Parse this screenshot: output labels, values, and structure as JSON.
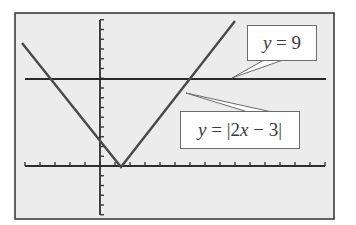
{
  "figure": {
    "background": "#ffffff",
    "screen_fill": "#ececec",
    "frame_color": "#3c3c3c",
    "axis_color": "#2e2e2e",
    "graph_color": "#4a4a4a",
    "line_color": "#2a2a2a"
  },
  "labels": {
    "horizontal_line": {
      "var": "y",
      "rest": " = 9"
    },
    "absolute_value": {
      "var": "y",
      "eq": " = |2",
      "var2": "x",
      "rest": " − 3|"
    }
  },
  "chart_data": {
    "type": "line",
    "title": "",
    "xlabel": "",
    "ylabel": "",
    "grid": false,
    "xlim": [
      -5,
      15
    ],
    "ylim": [
      -5,
      15
    ],
    "x_tick_spacing": 1,
    "y_tick_spacing": 1,
    "series": [
      {
        "name": "y = |2x − 3|",
        "x": [
          -5.2,
          1.5,
          9.0
        ],
        "y": [
          13.4,
          0,
          15
        ]
      },
      {
        "name": "y = 9",
        "x": [
          -5,
          15
        ],
        "y": [
          9,
          9
        ]
      }
    ],
    "intersections": [
      {
        "x": -3,
        "y": 9
      },
      {
        "x": 6,
        "y": 9
      }
    ],
    "annotations": [
      "y = 9",
      "y = |2x − 3|"
    ]
  }
}
